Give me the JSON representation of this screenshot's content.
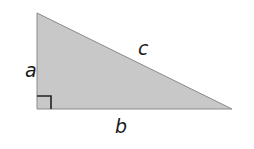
{
  "diagram": {
    "type": "right-triangle",
    "fill_color": "#c8c8c8",
    "stroke_color": "#8a8a8a",
    "labels": {
      "vertical_leg": "a",
      "horizontal_leg": "b",
      "hypotenuse": "c"
    },
    "right_angle_marker": true
  }
}
